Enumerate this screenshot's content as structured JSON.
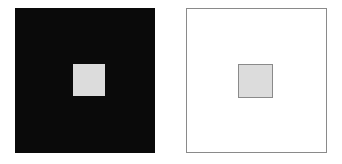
{
  "figure": {
    "type": "simultaneous-contrast-illusion",
    "background_color": "#ffffff",
    "width": 342,
    "height": 164,
    "panel_count": 2
  },
  "panels": [
    {
      "id": "dark-surround",
      "name": "black-surround-panel",
      "surround_label": "",
      "surround_color": "#0a0a0a",
      "surround_border_color": "none",
      "x": 15,
      "y": 8,
      "width": 140,
      "height": 145,
      "patch": {
        "name": "gray-target-patch-on-black",
        "label": "",
        "fill_color": "#dcdcdc",
        "border_color": "none",
        "x": 73,
        "y": 64,
        "width": 32,
        "height": 32
      }
    },
    {
      "id": "light-surround",
      "name": "white-surround-panel",
      "surround_label": "",
      "surround_color": "#ffffff",
      "surround_border_color": "#8a8a8a",
      "x": 186,
      "y": 8,
      "width": 141,
      "height": 145,
      "patch": {
        "name": "gray-target-patch-on-white",
        "label": "",
        "fill_color": "#dcdcdc",
        "border_color": "#8a8a8a",
        "x": 237,
        "y": 63,
        "width": 35,
        "height": 34
      }
    }
  ],
  "colors": {
    "page_background": "#ffffff",
    "dark_surround": "#0a0a0a",
    "light_surround": "#ffffff",
    "target_gray": "#dcdcdc",
    "stroke_gray": "#8a8a8a"
  },
  "caption": ""
}
